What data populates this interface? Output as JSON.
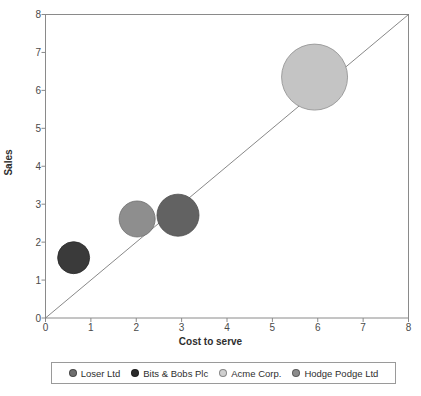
{
  "chart_data": {
    "type": "scatter",
    "title": "",
    "xlabel": "Cost to serve",
    "ylabel": "Sales",
    "xlim": [
      0,
      8
    ],
    "ylim": [
      0,
      8
    ],
    "xticks": [
      "0",
      "1",
      "2",
      "3",
      "4",
      "5",
      "6",
      "7",
      "8"
    ],
    "yticks": [
      "0",
      "1",
      "2",
      "3",
      "4",
      "5",
      "6",
      "7",
      "8"
    ],
    "grid": false,
    "legend_position": "bottom",
    "reference_line": {
      "name": "diagonal-parity-line",
      "from": [
        0,
        0
      ],
      "to": [
        8,
        8
      ],
      "color": "#6a6a6a"
    },
    "series": [
      {
        "name": "Loser Ltd",
        "x": 0.62,
        "y": 1.59,
        "size": 16,
        "color": "#3a3a3a",
        "edge": "#2a2a2a"
      },
      {
        "name": "Bits & Bobs Plc",
        "x": 2.02,
        "y": 2.61,
        "size": 18,
        "color": "#8e8e8e",
        "edge": "#6e6e6e"
      },
      {
        "name": "Acme Corp.",
        "x": 2.92,
        "y": 2.71,
        "size": 21,
        "color": "#626262",
        "edge": "#4c4c4c"
      },
      {
        "name": "Hodge Podge Ltd",
        "x": 5.93,
        "y": 6.35,
        "size": 33,
        "color": "#c4c4c4",
        "edge": "#8e8e8e"
      }
    ]
  },
  "axes": {
    "x_title": "Cost to serve",
    "y_title": "Sales",
    "x_tick_0": "0",
    "x_tick_1": "1",
    "x_tick_2": "2",
    "x_tick_3": "3",
    "x_tick_4": "4",
    "x_tick_5": "5",
    "x_tick_6": "6",
    "x_tick_7": "7",
    "x_tick_8": "8",
    "y_tick_0": "0",
    "y_tick_1": "1",
    "y_tick_2": "2",
    "y_tick_3": "3",
    "y_tick_4": "4",
    "y_tick_5": "5",
    "y_tick_6": "6",
    "y_tick_7": "7",
    "y_tick_8": "8"
  },
  "legend": {
    "items": [
      {
        "label": "Loser Ltd",
        "color": "#6e6e6e"
      },
      {
        "label": "Bits & Bobs Plc",
        "color": "#2b2b2b"
      },
      {
        "label": "Acme Corp.",
        "color": "#cfcfcf"
      },
      {
        "label": "Hodge Podge Ltd",
        "color": "#8c8c8c"
      }
    ]
  },
  "colors": {
    "axis": "#8a8a8a",
    "text": "#3a3a3a",
    "background": "#ffffff",
    "reference_line": "#6a6a6a",
    "legend_border": "#9a9a9a"
  }
}
